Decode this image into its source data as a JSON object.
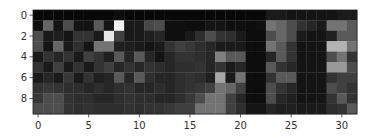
{
  "chart_data": {
    "type": "heatmap",
    "title": "",
    "xlabel": "",
    "ylabel": "",
    "colormap": "gray",
    "rows": 10,
    "cols": 32,
    "value_range": [
      0,
      1
    ],
    "x_ticks": [
      0,
      5,
      10,
      15,
      20,
      25,
      30
    ],
    "y_ticks": [
      0,
      2,
      4,
      6,
      8
    ],
    "grid": false,
    "legend": "none",
    "values": [
      [
        0.03,
        0.03,
        0.03,
        0.03,
        0.03,
        0.03,
        0.03,
        0.03,
        0.05,
        0.03,
        0.03,
        0.03,
        0.03,
        0.03,
        0.03,
        0.03,
        0.03,
        0.03,
        0.03,
        0.03,
        0.03,
        0.03,
        0.03,
        0.1,
        0.1,
        0.08,
        0.08,
        0.08,
        0.08,
        0.08,
        0.1,
        0.1
      ],
      [
        0.06,
        0.4,
        0.08,
        0.3,
        0.08,
        0.08,
        0.35,
        0.08,
        0.95,
        0.1,
        0.1,
        0.28,
        0.3,
        0.06,
        0.06,
        0.05,
        0.05,
        0.08,
        0.08,
        0.06,
        0.06,
        0.05,
        0.06,
        0.45,
        0.4,
        0.3,
        0.2,
        0.15,
        0.1,
        0.45,
        0.45,
        0.35
      ],
      [
        0.3,
        0.1,
        0.12,
        0.08,
        0.2,
        0.2,
        0.1,
        0.9,
        0.25,
        0.1,
        0.1,
        0.12,
        0.15,
        0.06,
        0.06,
        0.1,
        0.18,
        0.3,
        0.2,
        0.18,
        0.1,
        0.05,
        0.05,
        0.3,
        0.4,
        0.3,
        0.1,
        0.08,
        0.08,
        0.12,
        0.35,
        0.35
      ],
      [
        0.3,
        0.08,
        0.4,
        0.1,
        0.18,
        0.08,
        0.45,
        0.45,
        0.12,
        0.12,
        0.1,
        0.08,
        0.1,
        0.2,
        0.25,
        0.22,
        0.18,
        0.15,
        0.1,
        0.1,
        0.1,
        0.05,
        0.05,
        0.45,
        0.35,
        0.2,
        0.08,
        0.08,
        0.08,
        0.7,
        0.7,
        0.45
      ],
      [
        0.1,
        0.2,
        0.15,
        0.2,
        0.1,
        0.25,
        0.2,
        0.12,
        0.35,
        0.15,
        0.35,
        0.15,
        0.08,
        0.15,
        0.2,
        0.2,
        0.18,
        0.15,
        0.5,
        0.35,
        0.35,
        0.05,
        0.05,
        0.15,
        0.35,
        0.2,
        0.08,
        0.08,
        0.08,
        0.3,
        0.45,
        0.2
      ],
      [
        0.2,
        0.1,
        0.25,
        0.1,
        0.2,
        0.1,
        0.2,
        0.25,
        0.15,
        0.2,
        0.15,
        0.2,
        0.18,
        0.15,
        0.18,
        0.18,
        0.2,
        0.15,
        0.2,
        0.1,
        0.15,
        0.05,
        0.05,
        0.35,
        0.2,
        0.15,
        0.08,
        0.08,
        0.08,
        0.6,
        0.6,
        0.3
      ],
      [
        0.1,
        0.15,
        0.1,
        0.22,
        0.1,
        0.2,
        0.12,
        0.15,
        0.35,
        0.15,
        0.35,
        0.18,
        0.15,
        0.15,
        0.18,
        0.2,
        0.18,
        0.12,
        0.65,
        0.1,
        0.45,
        0.05,
        0.05,
        0.2,
        0.35,
        0.35,
        0.08,
        0.08,
        0.08,
        0.2,
        0.25,
        0.25
      ],
      [
        0.2,
        0.22,
        0.2,
        0.18,
        0.18,
        0.15,
        0.18,
        0.15,
        0.18,
        0.2,
        0.15,
        0.15,
        0.18,
        0.15,
        0.18,
        0.2,
        0.22,
        0.25,
        0.45,
        0.4,
        0.25,
        0.05,
        0.05,
        0.3,
        0.2,
        0.15,
        0.08,
        0.08,
        0.08,
        0.3,
        0.25,
        0.2
      ],
      [
        0.22,
        0.3,
        0.3,
        0.2,
        0.18,
        0.18,
        0.15,
        0.15,
        0.18,
        0.2,
        0.18,
        0.18,
        0.15,
        0.15,
        0.18,
        0.22,
        0.3,
        0.45,
        0.45,
        0.25,
        0.15,
        0.05,
        0.05,
        0.3,
        0.15,
        0.12,
        0.08,
        0.08,
        0.08,
        0.2,
        0.35,
        0.2
      ],
      [
        0.3,
        0.3,
        0.3,
        0.2,
        0.18,
        0.2,
        0.18,
        0.18,
        0.18,
        0.2,
        0.18,
        0.2,
        0.2,
        0.22,
        0.25,
        0.25,
        0.45,
        0.45,
        0.45,
        0.25,
        0.18,
        0.08,
        0.08,
        0.15,
        0.12,
        0.12,
        0.1,
        0.1,
        0.1,
        0.18,
        0.2,
        0.35
      ]
    ]
  }
}
